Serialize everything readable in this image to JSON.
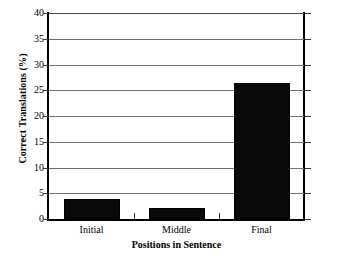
{
  "chart_data": {
    "type": "bar",
    "title": "",
    "subtitle": "",
    "categories": [
      "Initial",
      "Middle",
      "Final"
    ],
    "values": [
      3.8,
      2.2,
      26.4
    ],
    "xlabel": "Positions in Sentence",
    "ylabel": "Correct Translations (%)",
    "ylim": [
      0,
      40
    ],
    "ytick_labels": [
      "0",
      "5",
      "10",
      "15",
      "20",
      "25",
      "30",
      "35",
      "40"
    ],
    "ytick_values": [
      0,
      5,
      10,
      15,
      20,
      25,
      30,
      35,
      40
    ],
    "grid": true,
    "legend": null,
    "legend_position": "none",
    "bar_color": "#0a0a0a",
    "grid_color": "#6f6f6f",
    "axis_color": "#000000",
    "background_color": "#ffffff"
  }
}
